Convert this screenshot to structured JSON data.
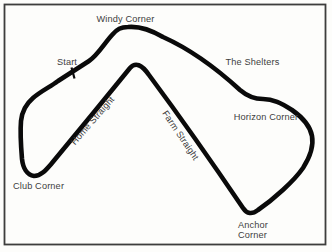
{
  "figure": {
    "background_color": "#fdfdfb",
    "frame_color": "#3d3d3d",
    "track_color": "#0a0a0a",
    "label_color": "#3e3e3e",
    "labels": {
      "windy_corner": "Windy Corner",
      "start": "Start",
      "the_shelters": "The Shelters",
      "horizon_corner": "Horizon Corner",
      "club_corner": "Club Corner",
      "anchor_corner_line1": "Anchor",
      "anchor_corner_line2": "Corner",
      "home_straight": "Home Straight",
      "farm_straight": "Farm Straight"
    }
  }
}
